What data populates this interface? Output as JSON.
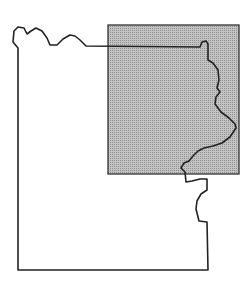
{
  "map": {
    "type": "locator-map",
    "region_outline": "county-boundary",
    "highlight": "shaded-study-area",
    "colors": {
      "background": "#ffffff",
      "outline": "#222222",
      "shade": "#b8b8b8"
    }
  }
}
